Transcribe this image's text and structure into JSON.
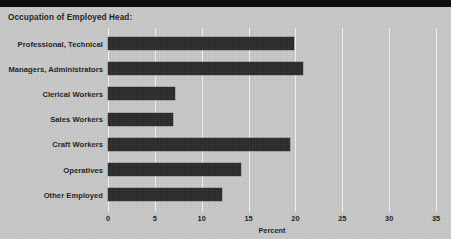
{
  "figure": {
    "width": 451,
    "height": 239,
    "background_color": "#c9c9c9",
    "bar_color": "#2b2b2b",
    "gridline_color": "#f4f4f4",
    "text_color": "#1d1d1d"
  },
  "chart_data": {
    "type": "bar",
    "orientation": "horizontal",
    "title": "Occupation of Employed Head:",
    "xlabel": "Percent",
    "ylabel": "",
    "grid": true,
    "legend": false,
    "xlim": [
      0,
      35
    ],
    "xticks": [
      0,
      5,
      10,
      15,
      20,
      25,
      30,
      35
    ],
    "xtick_labels": [
      "0",
      "5",
      "10",
      "15",
      "20",
      "25",
      "30",
      "35"
    ],
    "categories": [
      "Professional, Technical",
      "Managers, Administrators",
      "Clerical Workers",
      "Sales Workers",
      "Craft Workers",
      "Operatives",
      "Other Employed"
    ],
    "values": [
      19.9,
      20.8,
      7.2,
      6.9,
      19.4,
      14.2,
      12.2
    ]
  }
}
